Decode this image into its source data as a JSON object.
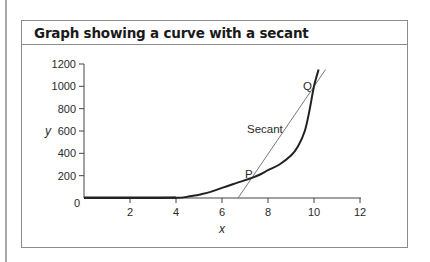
{
  "title": "Graph showing a curve with a secant",
  "colors": {
    "curve": "#222222",
    "secant": "#6a6a6a",
    "axis": "#444444",
    "frame": "#8c8c8c"
  },
  "chart_data": {
    "type": "line",
    "title": "Graph showing a curve with a secant",
    "xlabel": "x",
    "ylabel": "y",
    "xlim": [
      0,
      12
    ],
    "ylim": [
      0,
      1200
    ],
    "x_ticks": [
      0,
      2,
      4,
      6,
      8,
      10,
      12
    ],
    "y_ticks": [
      0,
      200,
      400,
      600,
      800,
      1000,
      1200
    ],
    "x_tick_labels": [
      "2",
      "4",
      "6",
      "8",
      "10",
      "12"
    ],
    "y_tick_labels": [
      "200",
      "400",
      "600",
      "800",
      "1000",
      "1200"
    ],
    "origin_label": "0",
    "grid": false,
    "legend": null,
    "series": [
      {
        "name": "curve",
        "style": "solid-thick",
        "x": [
          0,
          2,
          4,
          4.5,
          5,
          5.5,
          6,
          6.5,
          7,
          7.3,
          7.7,
          8,
          8.5,
          9,
          9.3,
          9.6,
          9.8,
          10,
          10.2
        ],
        "y": [
          0,
          0,
          2,
          12,
          30,
          55,
          90,
          125,
          160,
          180,
          215,
          250,
          300,
          380,
          460,
          600,
          780,
          1000,
          1150
        ]
      },
      {
        "name": "Secant",
        "style": "solid-thin",
        "x": [
          6.7,
          10.5
        ],
        "y": [
          0,
          1150
        ]
      }
    ],
    "annotations": [
      {
        "text": "P",
        "x": 7.3,
        "y": 180
      },
      {
        "text": "Q",
        "x": 10.0,
        "y": 1000
      },
      {
        "text": "Secant",
        "x": 8.0,
        "y": 600
      }
    ]
  },
  "labels": {
    "x_axis": "x",
    "y_axis": "y",
    "origin": "0",
    "point_p": "P",
    "point_q": "Q",
    "secant": "Secant",
    "xticks": [
      "2",
      "4",
      "6",
      "8",
      "10",
      "12"
    ],
    "yticks": [
      "200",
      "400",
      "600",
      "800",
      "1000",
      "1200"
    ]
  }
}
